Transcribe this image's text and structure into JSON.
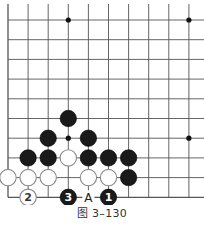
{
  "figure": {
    "caption": "图 3–130",
    "board": {
      "columns": 10,
      "rows": 10,
      "origin_x": 8,
      "origin_y": 20,
      "spacing_x": 20.1,
      "spacing_y": 19.7,
      "stone_radius": 8.2,
      "edges": {
        "left": true,
        "bottom": true,
        "top": false,
        "right": false
      },
      "line_color": "#555555",
      "star_points": [
        {
          "col": 3,
          "row": 0
        },
        {
          "col": 9,
          "row": 0
        },
        {
          "col": 3,
          "row": 6
        },
        {
          "col": 9,
          "row": 6
        }
      ],
      "stones": [
        {
          "color": "black",
          "col": 3,
          "row": 5,
          "label": ""
        },
        {
          "color": "black",
          "col": 2,
          "row": 6,
          "label": ""
        },
        {
          "color": "black",
          "col": 4,
          "row": 6,
          "label": ""
        },
        {
          "color": "black",
          "col": 1,
          "row": 7,
          "label": ""
        },
        {
          "color": "black",
          "col": 2,
          "row": 7,
          "label": ""
        },
        {
          "color": "white",
          "col": 3,
          "row": 7,
          "label": ""
        },
        {
          "color": "black",
          "col": 4,
          "row": 7,
          "label": ""
        },
        {
          "color": "black",
          "col": 5,
          "row": 7,
          "label": ""
        },
        {
          "color": "black",
          "col": 6,
          "row": 7,
          "label": ""
        },
        {
          "color": "white",
          "col": 0,
          "row": 8,
          "label": ""
        },
        {
          "color": "white",
          "col": 1,
          "row": 8,
          "label": ""
        },
        {
          "color": "white",
          "col": 2,
          "row": 8,
          "label": ""
        },
        {
          "color": "white",
          "col": 4,
          "row": 8,
          "label": ""
        },
        {
          "color": "white",
          "col": 5,
          "row": 8,
          "label": ""
        },
        {
          "color": "black",
          "col": 6,
          "row": 8,
          "label": ""
        },
        {
          "color": "white",
          "col": 1,
          "row": 9,
          "label": "2"
        },
        {
          "color": "black",
          "col": 3,
          "row": 9,
          "label": "3"
        },
        {
          "color": "black",
          "col": 5,
          "row": 9,
          "label": "1"
        }
      ],
      "markers": [
        {
          "col": 4,
          "row": 9,
          "label": "A"
        }
      ]
    }
  }
}
